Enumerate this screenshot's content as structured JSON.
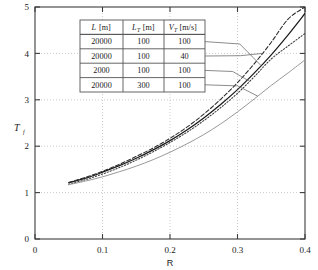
{
  "chart_data": {
    "type": "line",
    "title": "",
    "xlabel": "R",
    "ylabel": "T_f",
    "xlim": [
      0,
      0.4
    ],
    "ylim": [
      0,
      5
    ],
    "grid": true,
    "xticks": [
      "0",
      "0.1",
      "0.2",
      "0.3",
      "0.4"
    ],
    "xtick_values": [
      0,
      0.1,
      0.2,
      0.3,
      0.4
    ],
    "yticks": [
      "0",
      "1",
      "2",
      "3",
      "4",
      "5"
    ],
    "ytick_values": [
      0,
      1,
      2,
      3,
      4,
      5
    ],
    "legend_position": "inset-table-top-left",
    "series": [
      {
        "name": "L=20000, LT=100, VT=100",
        "style": "solid",
        "color": "#1a1a1a",
        "x": [
          0.05,
          0.075,
          0.1,
          0.125,
          0.15,
          0.175,
          0.2,
          0.225,
          0.25,
          0.275,
          0.3,
          0.325,
          0.35,
          0.375,
          0.4
        ],
        "y": [
          1.21,
          1.31,
          1.44,
          1.58,
          1.74,
          1.92,
          2.12,
          2.35,
          2.61,
          2.9,
          3.22,
          3.58,
          3.97,
          4.4,
          4.86
        ]
      },
      {
        "name": "L=20000, LT=100, VT=40",
        "style": "dashed",
        "color": "#2a2a2a",
        "x": [
          0.05,
          0.075,
          0.1,
          0.125,
          0.15,
          0.175,
          0.2,
          0.225,
          0.25,
          0.275,
          0.3,
          0.325,
          0.35,
          0.375,
          0.4
        ],
        "y": [
          1.22,
          1.33,
          1.46,
          1.61,
          1.78,
          1.96,
          2.17,
          2.41,
          2.69,
          3.01,
          3.37,
          3.78,
          4.24,
          4.74,
          5.0
        ]
      },
      {
        "name": "L=2000, LT=100, VT=100",
        "style": "dotted",
        "color": "#3a3a3a",
        "x": [
          0.05,
          0.075,
          0.1,
          0.125,
          0.15,
          0.175,
          0.2,
          0.225,
          0.25,
          0.275,
          0.3,
          0.325,
          0.35,
          0.375,
          0.4
        ],
        "y": [
          1.18,
          1.28,
          1.4,
          1.54,
          1.7,
          1.88,
          2.08,
          2.3,
          2.55,
          2.83,
          3.14,
          3.5,
          3.88,
          4.16,
          4.43
        ]
      },
      {
        "name": "L=20000, LT=300, VT=100",
        "style": "solid-light",
        "color": "#999999",
        "x": [
          0.05,
          0.075,
          0.1,
          0.125,
          0.15,
          0.175,
          0.2,
          0.225,
          0.25,
          0.275,
          0.3,
          0.325,
          0.35,
          0.375,
          0.4
        ],
        "y": [
          1.17,
          1.25,
          1.34,
          1.45,
          1.57,
          1.71,
          1.87,
          2.05,
          2.25,
          2.48,
          2.74,
          3.02,
          3.31,
          3.58,
          3.86
        ]
      }
    ]
  },
  "legend_table": {
    "headers": [
      {
        "symbol": "L",
        "sub": "",
        "unit": "[m]"
      },
      {
        "symbol": "L",
        "sub": "T",
        "unit": "[m]"
      },
      {
        "symbol": "V",
        "sub": "T",
        "unit": "[m/s]"
      }
    ],
    "header_plain": [
      "L [m]",
      "L_T [m]",
      "V_T [m/s]"
    ],
    "rows": [
      [
        "20000",
        "100",
        "100"
      ],
      [
        "20000",
        "100",
        "40"
      ],
      [
        "2000",
        "100",
        "100"
      ],
      [
        "20000",
        "300",
        "100"
      ]
    ]
  },
  "axes": {
    "y_label": "T",
    "y_label_sub": "f",
    "x_label": "R"
  },
  "colors": {
    "frame": "#3c3c3c",
    "grid": "#b4b4b4",
    "curve_solid": "#1a1a1a",
    "curve_dashed": "#2a2a2a",
    "curve_dotted": "#3a3a3a",
    "curve_light": "#999999",
    "leader": "#6e6e6e",
    "table_border": "#555555",
    "background": "#ffffff"
  }
}
